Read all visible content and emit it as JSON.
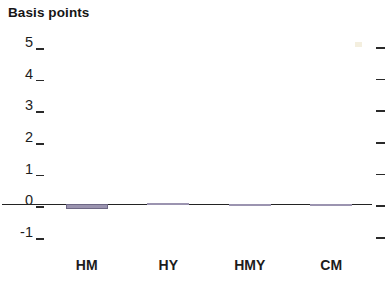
{
  "chart_data": {
    "type": "bar",
    "title": "Basis points",
    "xlabel": "",
    "ylabel": "Basis points",
    "categories": [
      "HM",
      "HY",
      "HMY",
      "CM"
    ],
    "values": [
      -0.15,
      0.03,
      -0.05,
      -0.05
    ],
    "series": [
      {
        "name": "Basis points",
        "values": [
          -0.15,
          0.03,
          -0.05,
          -0.05
        ]
      }
    ],
    "ylim": [
      -1,
      5
    ],
    "yticks": [
      5,
      4,
      3,
      2,
      1,
      0,
      -1
    ],
    "ytick_labels": [
      "5",
      "4",
      "3",
      "2",
      "1",
      "0",
      "-1"
    ],
    "grid": false,
    "legend": "none",
    "bar_color": "#9b94b0",
    "zero_line_color": "#232323",
    "axis_text_color": "#1c1c1c"
  },
  "axis": {
    "tick_right_marks": [
      "5",
      "4",
      "3",
      "2",
      "1",
      "0",
      "-1"
    ]
  }
}
